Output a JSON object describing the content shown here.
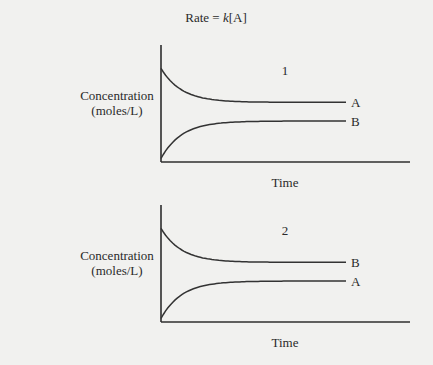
{
  "title": {
    "prefix": "Rate = ",
    "k": "k",
    "suffix": "[A]"
  },
  "chart_data": [
    {
      "type": "line",
      "panel_label": "1",
      "xlabel": "Time",
      "ylabel_line1": "Concentration",
      "ylabel_line2": "(moles/L)",
      "xlim": [
        0,
        1
      ],
      "ylim": [
        0,
        1
      ],
      "grid": false,
      "series": [
        {
          "name": "A",
          "start": 0.8,
          "end": 0.51,
          "trend": "decreasing"
        },
        {
          "name": "B",
          "start": 0.03,
          "end": 0.35,
          "trend": "increasing"
        }
      ]
    },
    {
      "type": "line",
      "panel_label": "2",
      "xlabel": "Time",
      "ylabel_line1": "Concentration",
      "ylabel_line2": "(moles/L)",
      "xlim": [
        0,
        1
      ],
      "ylim": [
        0,
        1
      ],
      "grid": false,
      "series": [
        {
          "name": "B",
          "start": 0.8,
          "end": 0.51,
          "trend": "decreasing"
        },
        {
          "name": "A",
          "start": 0.03,
          "end": 0.35,
          "trend": "increasing"
        }
      ]
    }
  ]
}
